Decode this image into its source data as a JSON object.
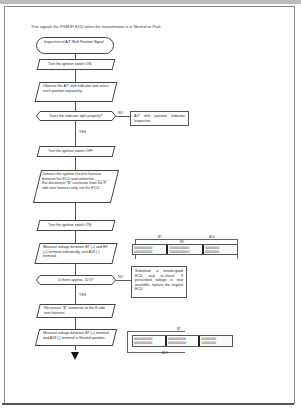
{
  "intro": "This signals the PGM-FI ECU when the transmission is in Neutral or Park.",
  "flow": {
    "start": "Inspection of A/T Shift Position Signal",
    "step1": "Turn the ignition switch ON.",
    "step2": "Observe the A/T shift indicator and select each position separately.",
    "decision1": "Does the indicator light properly?",
    "decision1_no": "NO",
    "decision1_yes": "YES",
    "no_box1": "A/T shift position Indicator Inspection",
    "step3": "Turn the ignition switch OFF.",
    "step4": "Connect the system checker harness between the ECU and connector ______. But disconnect \"B\" connector from the R side wire harness only, not the ECU.",
    "step5": "Turn the ignition switch ON.",
    "step6": "Measure voltage between B7 (+) and B9 (+) terminal individually, and A18 (-) terminal.",
    "decision2": "Is there approx. 10 V?",
    "decision2_no": "NO",
    "decision2_yes": "YES",
    "no_box2": "Substitute a known-good ECU and re-check. If prescribed voltage is now available, replace the original ECU.",
    "step7": "Reconnect \"B\" connector to the R side wire harness.",
    "step8": "Measure voltage between B7 (+) terminal and A18 (-) terminal in Neutral position."
  },
  "connector1": {
    "labels": [
      "B7",
      "B9",
      "A18"
    ],
    "rows": [
      "OOOOOOOOOO",
      "OOOOOOOOOO",
      "OOOOOOOOOOO",
      "OOOOOOOOOOO",
      "OOOOOOOO",
      "OOOOOOOO"
    ]
  },
  "connector2": {
    "labels": [
      "B7",
      "A18"
    ],
    "rows": [
      "OOOOOOOOOO",
      "OOOOOOOOOO",
      "OOOOOOOOOO",
      "OOOOOOOOOO",
      "OOOOOOOO",
      "OOOOOOOO"
    ]
  }
}
